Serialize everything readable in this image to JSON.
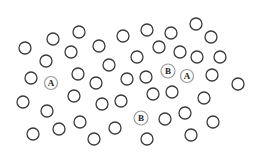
{
  "diagram": {
    "colors": {
      "background": "#ffffff",
      "plain_circle_stroke": "#3a3a3a",
      "labeled_circle_stroke": "#9a9a9a",
      "label_text": "#222222"
    },
    "circle_radius": 6,
    "plain_circles": [
      [
        79,
        32
      ],
      [
        53,
        39
      ],
      [
        25,
        48
      ],
      [
        99,
        46
      ],
      [
        123,
        36
      ],
      [
        147,
        30
      ],
      [
        171,
        33
      ],
      [
        196,
        24
      ],
      [
        211,
        37
      ],
      [
        46,
        61
      ],
      [
        71,
        52
      ],
      [
        137,
        57
      ],
      [
        159,
        47
      ],
      [
        180,
        52
      ],
      [
        197,
        57
      ],
      [
        220,
        57
      ],
      [
        109,
        65
      ],
      [
        31,
        78
      ],
      [
        78,
        74
      ],
      [
        96,
        83
      ],
      [
        127,
        79
      ],
      [
        146,
        77
      ],
      [
        212,
        75
      ],
      [
        238,
        84
      ],
      [
        23,
        102
      ],
      [
        47,
        111
      ],
      [
        74,
        96
      ],
      [
        102,
        104
      ],
      [
        121,
        101
      ],
      [
        153,
        94
      ],
      [
        172,
        92
      ],
      [
        204,
        98
      ],
      [
        33,
        134
      ],
      [
        59,
        129
      ],
      [
        80,
        122
      ],
      [
        94,
        139
      ],
      [
        115,
        128
      ],
      [
        165,
        119
      ],
      [
        185,
        113
      ],
      [
        213,
        122
      ],
      [
        147,
        139
      ],
      [
        191,
        135
      ]
    ],
    "labeled_circles": [
      {
        "label": "A",
        "x": 51,
        "y": 83,
        "r": 6.5
      },
      {
        "label": "B",
        "x": 168,
        "y": 71,
        "r": 7
      },
      {
        "label": "A",
        "x": 187,
        "y": 76,
        "r": 6.5
      },
      {
        "label": "B",
        "x": 141,
        "y": 118,
        "r": 7
      }
    ]
  }
}
